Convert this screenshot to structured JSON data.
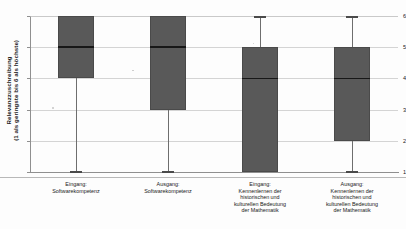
{
  "chart_data": {
    "type": "boxplot",
    "title": "",
    "xlabel": "",
    "ylabel_line1": "Relevanzzuschreibung",
    "ylabel_line2": "(1 als geringste bis 6 als höchste)",
    "ylim": [
      1,
      6
    ],
    "yticks": [
      "1",
      "2",
      "3",
      "4",
      "5",
      "6"
    ],
    "grid": true,
    "legend": "none",
    "categories": [
      "Eingang: Softwarekompetenz",
      "Ausgang: Softwarekompetenz",
      "Eingang: Kennenlernen der historischen und kulturellen Bedeutung der Mathematik",
      "Ausgang: Kennenlernen der historischen und kulturellen Bedeutung der Mathematik"
    ],
    "boxes": [
      {
        "name": "Eingang: Softwarekompetenz",
        "label_lines": [
          "Eingang:",
          "Softwarekompetenz"
        ],
        "whisker_low": 1,
        "q1": 4,
        "median": 5,
        "q3": 6,
        "whisker_high": 6
      },
      {
        "name": "Ausgang: Softwarekompetenz",
        "label_lines": [
          "Ausgang:",
          "Softwarekompetenz"
        ],
        "whisker_low": 1,
        "q1": 3,
        "median": 5,
        "q3": 6,
        "whisker_high": 6
      },
      {
        "name": "Eingang: Kennenlernen der historischen und kulturellen Bedeutung der Mathematik",
        "label_lines": [
          "Eingang:",
          "Kennenlernen der",
          "historischen und",
          "kulturellen Bedeutung",
          "der Mathematik"
        ],
        "whisker_low": 1,
        "q1": 1,
        "median": 4,
        "q3": 5,
        "whisker_high": 6
      },
      {
        "name": "Ausgang: Kennenlernen der historischen und kulturellen Bedeutung der Mathematik",
        "label_lines": [
          "Ausgang:",
          "Kennenlernen der",
          "historischen und",
          "kulturellen Bedeutung",
          "der Mathematik"
        ],
        "whisker_low": 1,
        "q1": 2,
        "median": 4,
        "q3": 5,
        "whisker_high": 6
      }
    ],
    "colors": {
      "box_fill": "#595959",
      "box_edge": "#4a4a4a",
      "median": "#171717",
      "whisker": "#6e6e6e",
      "grid": "#d4d4d4",
      "axis": "#8f8f8f",
      "background": "#fdfdfd"
    }
  }
}
